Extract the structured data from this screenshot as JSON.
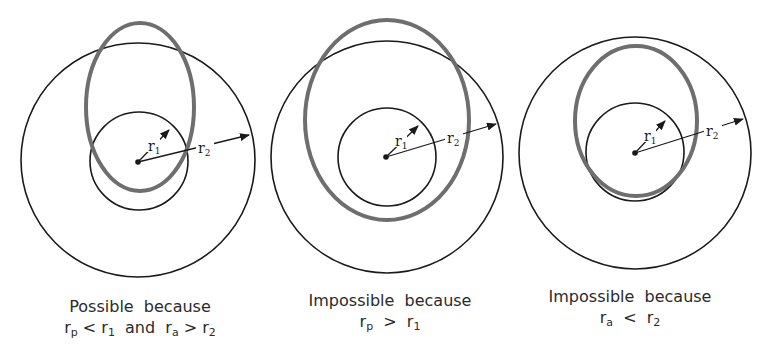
{
  "figure": {
    "panels": [
      {
        "id": "possible",
        "caption_line1": "Possible  because",
        "caption_line2": {
          "a": "r",
          "a_sub": "p",
          "op1": " < ",
          "b": "r",
          "b_sub": "1",
          "mid": "  and  ",
          "c": "r",
          "c_sub": "a",
          "op2": " > ",
          "d": "r",
          "d_sub": "2"
        },
        "labels": {
          "r1": "r",
          "r1_sub": "1",
          "r2": "r",
          "r2_sub": "2"
        }
      },
      {
        "id": "impossible-rp",
        "caption_line1": "Impossible  because",
        "caption_line2": {
          "a": "r",
          "a_sub": "p",
          "op1": "  >  ",
          "b": "r",
          "b_sub": "1"
        },
        "labels": {
          "r1": "r",
          "r1_sub": "1",
          "r2": "r",
          "r2_sub": "2"
        }
      },
      {
        "id": "impossible-ra",
        "caption_line1": "Impossible  because",
        "caption_line2": {
          "a": "r",
          "a_sub": "a",
          "op1": "  <  ",
          "b": "r",
          "b_sub": "2"
        },
        "labels": {
          "r1": "r",
          "r1_sub": "1",
          "r2": "r",
          "r2_sub": "2"
        }
      }
    ],
    "colors": {
      "circle": "#1a1a1a",
      "orbit": "#6e6e6e",
      "text": "#2a2a2a"
    }
  }
}
